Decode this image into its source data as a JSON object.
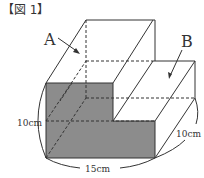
{
  "figure": {
    "title": "【図 1】",
    "labels": {
      "a": "A",
      "b": "B",
      "height": "10cm",
      "width": "15cm",
      "depth": "10cm"
    },
    "colors": {
      "face_fill": "#8c8c8c",
      "line": "#333333",
      "background": "#ffffff"
    }
  }
}
